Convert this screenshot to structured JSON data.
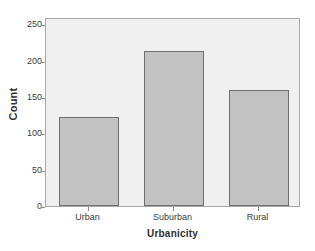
{
  "chart_data": {
    "type": "bar",
    "title": "",
    "categories": [
      "Urban",
      "Suburban",
      "Rural"
    ],
    "values": [
      122,
      213,
      160
    ],
    "xlabel": "Urbanicity",
    "ylabel": "Count",
    "ylim": [
      0,
      260
    ],
    "yticks": [
      0,
      50,
      100,
      150,
      200,
      250
    ],
    "ytick_labels": [
      "0",
      "50",
      "100",
      "150",
      "200",
      "250"
    ],
    "grid": false,
    "legend": false,
    "bar_color": "#c2c2c2",
    "bar_edge_color": "#6e6e6e",
    "panel_color": "#f0f0f0",
    "panel_edge_color": "#a8a8a8",
    "background_color": "#ffffff"
  }
}
